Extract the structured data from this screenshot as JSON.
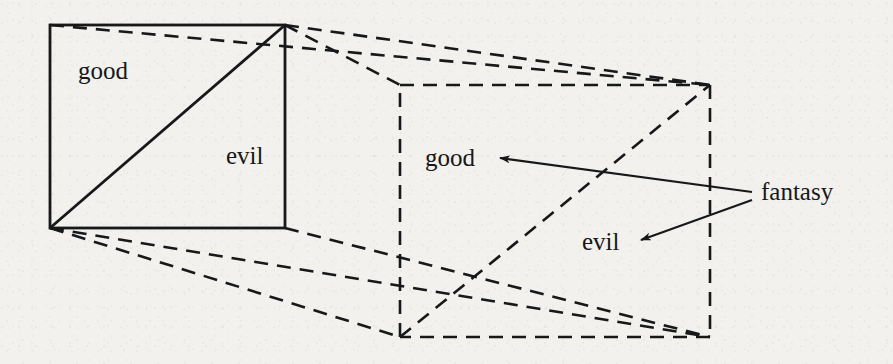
{
  "figure": {
    "kind": "geometric-diagram",
    "canvas": {
      "width": 893,
      "height": 364
    },
    "colors": {
      "paper": "#f2f1ed",
      "ink": "#16181a",
      "solid_stroke": "#16181a",
      "dashed_stroke": "#16181a"
    },
    "labels": {
      "good_front": "good",
      "evil_front": "evil",
      "good_back": "good",
      "evil_back": "evil",
      "fantasy": "fantasy"
    },
    "geometry": {
      "front_square": {
        "x1": 50,
        "y1": 25,
        "x2": 285,
        "y2": 228,
        "style": "solid"
      },
      "front_diagonal": {
        "x1": 50,
        "y1": 228,
        "x2": 285,
        "y2": 25,
        "style": "solid"
      },
      "back_square": {
        "x1": 400,
        "y1": 85,
        "x2": 710,
        "y2": 337,
        "style": "dashed"
      },
      "back_diagonal": {
        "x1": 400,
        "y1": 337,
        "x2": 710,
        "y2": 85,
        "style": "dashed"
      },
      "connectors": [
        {
          "x1": 50,
          "y1": 25,
          "x2": 710,
          "y2": 85,
          "style": "dashed"
        },
        {
          "x1": 285,
          "y1": 25,
          "x2": 400,
          "y2": 85,
          "style": "dashed"
        },
        {
          "x1": 285,
          "y1": 25,
          "x2": 710,
          "y2": 85,
          "style": "dashed"
        },
        {
          "x1": 50,
          "y1": 228,
          "x2": 400,
          "y2": 337,
          "style": "dashed"
        },
        {
          "x1": 50,
          "y1": 228,
          "x2": 710,
          "y2": 337,
          "style": "dashed"
        },
        {
          "x1": 285,
          "y1": 228,
          "x2": 710,
          "y2": 337,
          "style": "dashed"
        }
      ],
      "leader_arrows": [
        {
          "name": "fantasy-to-good",
          "from_x": 752,
          "from_y": 192,
          "to_x": 498,
          "to_y": 158
        },
        {
          "name": "fantasy-to-evil",
          "from_x": 752,
          "from_y": 200,
          "to_x": 639,
          "to_y": 240
        }
      ]
    }
  }
}
